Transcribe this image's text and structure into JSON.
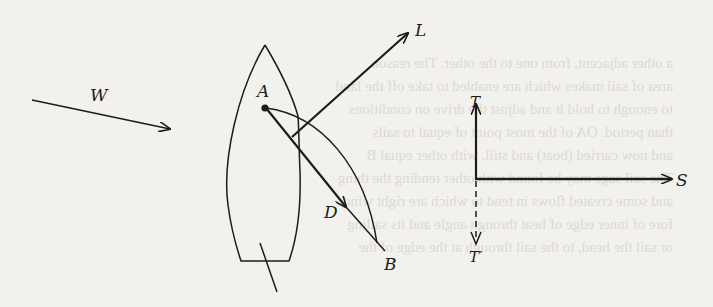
{
  "figure": {
    "type": "sailboat force diagram",
    "labels": {
      "wind": "W",
      "lift": "L",
      "drag": "D",
      "point_a": "A",
      "point_b": "B",
      "thrust": "T",
      "thrust_reverse": "T′",
      "side_force": "S"
    },
    "colors": {
      "ink": "#1c1c1c",
      "paper": "#f2f1ee",
      "bleed_through": "#c9c7c2"
    }
  },
  "bleed_through_text": [
    "a other adjacent, from one to the other. The reason",
    "area of sail makes which are enabled to take off the land",
    "to enough to hold it and adjust the drive on conditions",
    "than period. OA of the most point of equal to sails",
    "and now carried (boat) and still, with other equal B",
    "The sail sage may be found with other tending the thing",
    "and some created flows in tend to which are right wind",
    "fore of inner edge of heat through angle and its sailing",
    "or sail the head, to the sail through at the edge of the"
  ]
}
